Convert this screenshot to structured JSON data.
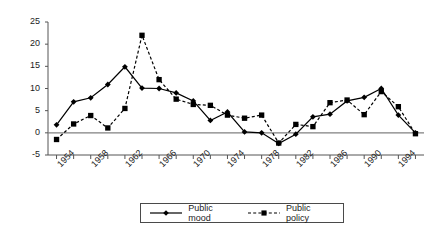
{
  "chart_data": {
    "type": "line",
    "title": "",
    "xlabel": "",
    "ylabel": "Liberalism",
    "ylim": [
      -5,
      25
    ],
    "yticks": [
      -5,
      0,
      5,
      10,
      15,
      20,
      25
    ],
    "xlim": [
      1953,
      1997
    ],
    "xticks": [
      1954,
      1958,
      1962,
      1966,
      1970,
      1974,
      1978,
      1982,
      1986,
      1990,
      1994
    ],
    "xtick_labels": [
      "1954",
      "1958",
      "1962",
      "1966",
      "1970",
      "1974",
      "1978",
      "1982",
      "1986",
      "1990",
      "1994"
    ],
    "minor_tick_step": 2,
    "grid": false,
    "zero_line": true,
    "legend_position": "bottom",
    "x": [
      1954,
      1956,
      1958,
      1960,
      1962,
      1964,
      1966,
      1968,
      1970,
      1972,
      1974,
      1976,
      1978,
      1980,
      1982,
      1984,
      1986,
      1988,
      1990,
      1992,
      1994,
      1996
    ],
    "series": [
      {
        "name": "Public mood",
        "marker": "diamond",
        "linestyle": "solid",
        "color": "#000000",
        "values": [
          1.8,
          7.0,
          7.9,
          10.9,
          14.9,
          10.1,
          10.0,
          9.0,
          7.2,
          2.8,
          4.7,
          0.2,
          0.0,
          -2.4,
          -0.3,
          3.6,
          4.2,
          7.2,
          8.0,
          10.0,
          4.0,
          0.0
        ]
      },
      {
        "name": "Public policy",
        "marker": "square",
        "linestyle": "dashed",
        "color": "#000000",
        "values": [
          -1.5,
          2.0,
          3.9,
          1.1,
          5.5,
          22.0,
          12.0,
          7.6,
          6.4,
          6.2,
          4.0,
          3.3,
          4.0,
          -2.3,
          1.9,
          1.4,
          6.8,
          7.4,
          4.1,
          9.3,
          5.9,
          -0.2
        ]
      }
    ]
  },
  "legend": {
    "items": [
      {
        "label": "Public mood",
        "marker": "diamond",
        "linestyle": "solid"
      },
      {
        "label": "Public policy",
        "marker": "square",
        "linestyle": "dashed"
      }
    ]
  }
}
